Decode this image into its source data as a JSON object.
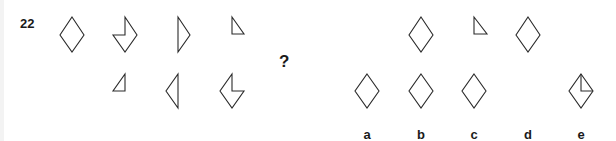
{
  "question": {
    "number": "22",
    "prompt_symbol": "?"
  },
  "stroke_color": "#2a2a2a",
  "sequence": {
    "top_row": [
      {
        "shape": "full-diamond"
      },
      {
        "shape": "diamond-missing-upper-left-quarter"
      },
      {
        "shape": "right-half-diamond"
      },
      {
        "shape": "upper-right-quarter-triangle"
      }
    ],
    "bottom_row": [
      {
        "shape": "upper-left-quarter-triangle"
      },
      {
        "shape": "left-half-diamond"
      },
      {
        "shape": "diamond-missing-upper-right-quarter"
      }
    ]
  },
  "options": [
    {
      "label": "a",
      "top": null,
      "bottom": "full-diamond"
    },
    {
      "label": "b",
      "top": "full-diamond",
      "bottom": "full-diamond"
    },
    {
      "label": "c",
      "top": "upper-right-quarter-triangle",
      "bottom": "full-diamond"
    },
    {
      "label": "d",
      "top": "full-diamond",
      "bottom": null
    },
    {
      "label": "e",
      "top": null,
      "bottom": "full-diamond-with-upper-right-quarter-lines"
    }
  ]
}
